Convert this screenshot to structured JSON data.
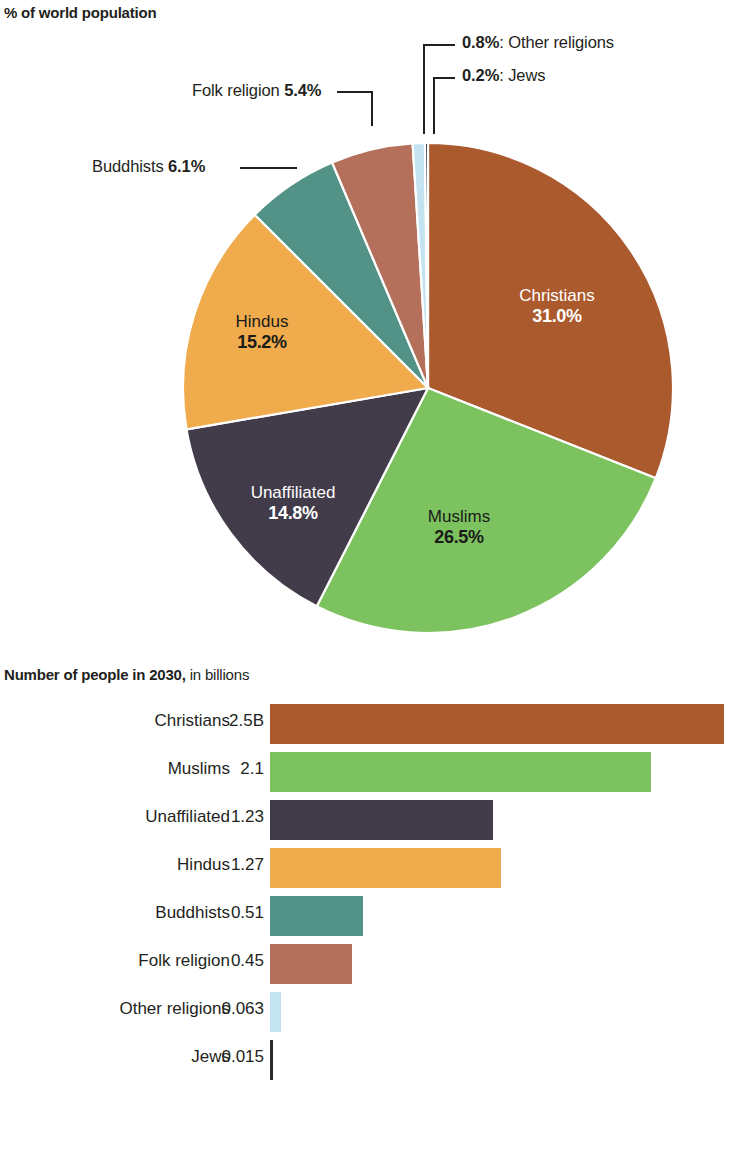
{
  "pie_section": {
    "title": "% of world population"
  },
  "bar_section": {
    "title_bold": "Number of people in 2030,",
    "title_light": " in billions"
  },
  "callouts": {
    "other_pct": "0.8%",
    "other_name": ": Other religions",
    "jews_pct": "0.2%",
    "jews_name": ": Jews",
    "folk_name": "Folk religion ",
    "folk_pct": "5.4%",
    "buddhists_name": "Buddhists ",
    "buddhists_pct": "6.1%"
  },
  "pie_labels": {
    "christians_name": "Christians",
    "christians_pct": "31.0%",
    "muslims_name": "Muslims",
    "muslims_pct": "26.5%",
    "unaffiliated_name": "Unaffiliated",
    "unaffiliated_pct": "14.8%",
    "hindus_name": "Hindus",
    "hindus_pct": "15.2%"
  },
  "colors": {
    "christians": "#ab5a2d",
    "muslims": "#7cc35f",
    "unaffiliated": "#423b4a",
    "hindus": "#f0ab4c",
    "buddhists": "#539287",
    "folk": "#b4705a",
    "other": "#c2e3ef",
    "jews": "#2b2b2b",
    "text": "#231f20",
    "background": "#ffffff"
  },
  "chart_data": [
    {
      "type": "pie",
      "title": "% of world population",
      "unit": "percent",
      "start_angle_deg": 0,
      "direction": "clockwise",
      "labels": [
        "Christians",
        "Muslims",
        "Unaffiliated",
        "Hindus",
        "Buddhists",
        "Folk religion",
        "Other religions",
        "Jews"
      ],
      "values": [
        31.0,
        26.5,
        14.8,
        15.2,
        6.1,
        5.4,
        0.8,
        0.2
      ],
      "value_text": [
        "31.0%",
        "26.5%",
        "14.8%",
        "15.2%",
        "6.1%",
        "5.4%",
        "0.8%",
        "0.2%"
      ],
      "colors": [
        "#ab5a2d",
        "#7cc35f",
        "#423b4a",
        "#f0ab4c",
        "#539287",
        "#b4705a",
        "#c2e3ef",
        "#2b2b2b"
      ],
      "label_placement": [
        "inside",
        "inside",
        "inside",
        "inside",
        "callout",
        "callout",
        "callout",
        "callout"
      ],
      "legend": "none"
    },
    {
      "type": "bar",
      "orientation": "horizontal",
      "title": "Number of people in 2030, in billions",
      "xlabel": "",
      "ylabel": "",
      "unit": "billions",
      "categories": [
        "Christians",
        "Muslims",
        "Unaffiliated",
        "Hindus",
        "Buddhists",
        "Folk religion",
        "Other religions",
        "Jews"
      ],
      "values": [
        2.5,
        2.1,
        1.23,
        1.27,
        0.51,
        0.45,
        0.063,
        0.015
      ],
      "value_labels": [
        "2.5B",
        "2.1",
        "1.23",
        "1.27",
        "0.51",
        "0.45",
        "0.063",
        "0.015"
      ],
      "colors": [
        "#ab5a2d",
        "#7cc35f",
        "#423b4a",
        "#f0ab4c",
        "#539287",
        "#b4705a",
        "#c2e3ef",
        "#2b2b2b"
      ],
      "xlim": [
        0,
        2.54
      ],
      "grid": false,
      "legend": "none"
    }
  ],
  "bars": [
    {
      "label": "Christians",
      "value_text": "2.5B",
      "value": 2.5,
      "color": "#ab5a2d"
    },
    {
      "label": "Muslims",
      "value_text": "2.1",
      "value": 2.1,
      "color": "#7cc35f"
    },
    {
      "label": "Unaffiliated",
      "value_text": "1.23",
      "value": 1.23,
      "color": "#423b4a"
    },
    {
      "label": "Hindus",
      "value_text": "1.27",
      "value": 1.27,
      "color": "#f0ab4c"
    },
    {
      "label": "Buddhists",
      "value_text": "0.51",
      "value": 0.51,
      "color": "#539287"
    },
    {
      "label": "Folk religion",
      "value_text": "0.45",
      "value": 0.45,
      "color": "#b4705a"
    },
    {
      "label": "Other religions",
      "value_text": "0.063",
      "value": 0.063,
      "color": "#c2e3ef"
    },
    {
      "label": "Jews",
      "value_text": "0.015",
      "value": 0.015,
      "color": "#2b2b2b"
    }
  ]
}
